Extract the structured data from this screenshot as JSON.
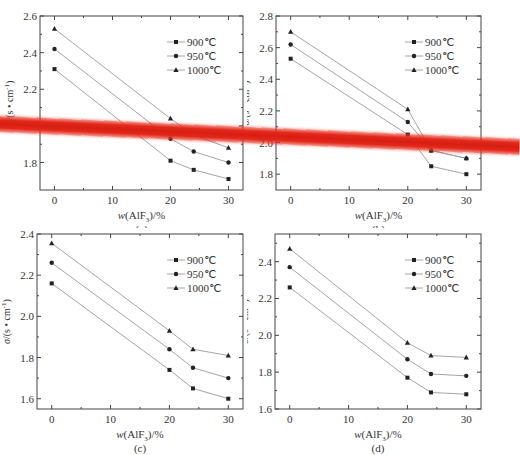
{
  "chart_data": [
    {
      "id": "a",
      "type": "line",
      "caption": "(a)",
      "xlabel": "w(AlF3)/%",
      "ylabel": "σ/(s·cm⁻¹)",
      "x": [
        0,
        20,
        24,
        30
      ],
      "xticks": [
        0,
        10,
        20,
        30
      ],
      "xlim": [
        -2.5,
        32.5
      ],
      "yticks": [
        1.8,
        2.0,
        2.2,
        2.4,
        2.6
      ],
      "ylim": [
        1.65,
        2.6
      ],
      "legend_position": "upper right",
      "series": [
        {
          "name": "900℃",
          "marker": "square",
          "values": [
            2.31,
            1.81,
            1.76,
            1.71
          ]
        },
        {
          "name": "950℃",
          "marker": "circle",
          "values": [
            2.42,
            1.93,
            1.86,
            1.8
          ]
        },
        {
          "name": "1000℃",
          "marker": "triangle",
          "values": [
            2.53,
            2.04,
            1.95,
            1.88
          ]
        }
      ]
    },
    {
      "id": "b",
      "type": "line",
      "caption": "(b)",
      "xlabel": "w(AlF3)/%",
      "ylabel": "σ/(s·cm⁻¹)",
      "x": [
        0,
        20,
        24,
        30
      ],
      "xticks": [
        0,
        10,
        20,
        30
      ],
      "xlim": [
        -2.5,
        32.5
      ],
      "yticks": [
        1.8,
        2.0,
        2.2,
        2.4,
        2.6,
        2.8
      ],
      "ylim": [
        1.7,
        2.8
      ],
      "legend_position": "upper right",
      "series": [
        {
          "name": "900℃",
          "marker": "square",
          "values": [
            2.53,
            2.05,
            1.85,
            1.8
          ]
        },
        {
          "name": "950℃",
          "marker": "circle",
          "values": [
            2.62,
            2.13,
            1.95,
            1.9
          ]
        },
        {
          "name": "1000℃",
          "marker": "triangle",
          "values": [
            2.7,
            2.21,
            1.95,
            1.9
          ]
        }
      ]
    },
    {
      "id": "c",
      "type": "line",
      "caption": "(c)",
      "xlabel": "w(AlF3)/%",
      "ylabel": "σ/(s·cm⁻¹)",
      "x": [
        0,
        20,
        24,
        30
      ],
      "xticks": [
        0,
        10,
        20,
        30
      ],
      "xlim": [
        -2.5,
        32.5
      ],
      "yticks": [
        1.6,
        1.8,
        2.0,
        2.2,
        2.4
      ],
      "ylim": [
        1.55,
        2.4
      ],
      "legend_position": "upper right",
      "series": [
        {
          "name": "900℃",
          "marker": "square",
          "values": [
            2.16,
            1.74,
            1.65,
            1.6
          ]
        },
        {
          "name": "950℃",
          "marker": "circle",
          "values": [
            2.26,
            1.84,
            1.75,
            1.7
          ]
        },
        {
          "name": "1000℃",
          "marker": "triangle",
          "values": [
            2.355,
            1.93,
            1.84,
            1.81
          ]
        }
      ]
    },
    {
      "id": "d",
      "type": "line",
      "caption": "(d)",
      "xlabel": "w(AlF3)/%",
      "ylabel": "σ/(s·cm⁻¹)",
      "x": [
        0,
        20,
        24,
        30
      ],
      "xticks": [
        0,
        10,
        20,
        30
      ],
      "xlim": [
        -2.5,
        32.5
      ],
      "yticks": [
        1.6,
        1.8,
        2.0,
        2.2,
        2.4
      ],
      "ylim": [
        1.6,
        2.55
      ],
      "legend_position": "upper right",
      "series": [
        {
          "name": "900℃",
          "marker": "square",
          "values": [
            2.26,
            1.77,
            1.69,
            1.68
          ]
        },
        {
          "name": "950℃",
          "marker": "circle",
          "values": [
            2.37,
            1.87,
            1.79,
            1.78
          ]
        },
        {
          "name": "1000℃",
          "marker": "triangle",
          "values": [
            2.47,
            1.96,
            1.89,
            1.88
          ]
        }
      ]
    }
  ],
  "labels": {
    "xlabel_main": "w(AlF",
    "xlabel_sub": "3",
    "xlabel_tail": ")/%",
    "ylabel_main": "σ/(s • cm",
    "ylabel_sup": "-1",
    "ylabel_tail": ")"
  },
  "overlay": {
    "type": "red-stripe",
    "color": "#d81e12"
  }
}
